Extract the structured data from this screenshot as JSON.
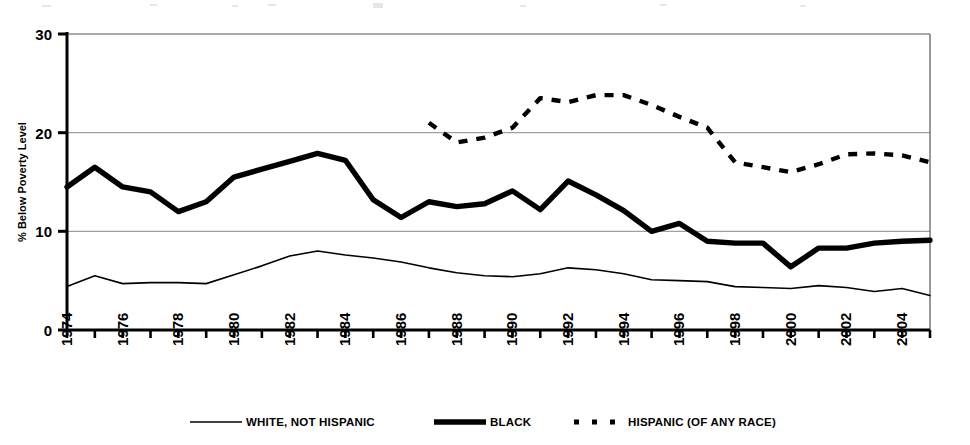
{
  "chart_data": {
    "type": "line",
    "title": "",
    "xlabel": "",
    "ylabel": "% Below Poverty Level",
    "xlim": [
      1974,
      2005
    ],
    "ylim": [
      0,
      30
    ],
    "yticks": [
      0,
      10,
      20,
      30
    ],
    "ytick_labels": [
      "0",
      "10",
      "20",
      "30"
    ],
    "xticks": [
      1974,
      1975,
      1976,
      1977,
      1978,
      1979,
      1980,
      1981,
      1982,
      1983,
      1984,
      1985,
      1986,
      1987,
      1988,
      1989,
      1990,
      1991,
      1992,
      1993,
      1994,
      1995,
      1996,
      1997,
      1998,
      1999,
      2000,
      2001,
      2002,
      2003,
      2004,
      2005
    ],
    "xtick_labels": [
      "1974",
      "",
      "1976",
      "",
      "1978",
      "",
      "1980",
      "",
      "1982",
      "",
      "1984",
      "",
      "1986",
      "",
      "1988",
      "",
      "1990",
      "",
      "1992",
      "",
      "1994",
      "",
      "1996",
      "",
      "1998",
      "",
      "2000",
      "",
      "2002",
      "",
      "2004",
      ""
    ],
    "grid": "horizontal",
    "legend_position": "bottom",
    "series": [
      {
        "name": "WHITE, NOT HISPANIC",
        "style": "thin-solid",
        "color": "#000000",
        "x": [
          1974,
          1975,
          1976,
          1977,
          1978,
          1979,
          1980,
          1981,
          1982,
          1983,
          1984,
          1985,
          1986,
          1987,
          1988,
          1989,
          1990,
          1991,
          1992,
          1993,
          1994,
          1995,
          1996,
          1997,
          1998,
          1999,
          2000,
          2001,
          2002,
          2003,
          2004,
          2005
        ],
        "values": [
          4.4,
          5.5,
          4.7,
          4.8,
          4.8,
          4.7,
          5.6,
          6.5,
          7.5,
          8.0,
          7.6,
          7.3,
          6.9,
          6.3,
          5.8,
          5.5,
          5.4,
          5.7,
          6.3,
          6.1,
          5.7,
          5.1,
          5.0,
          4.9,
          4.4,
          4.3,
          4.2,
          4.5,
          4.3,
          3.9,
          4.2,
          3.5
        ]
      },
      {
        "name": "BLACK",
        "style": "thick-solid",
        "color": "#000000",
        "x": [
          1974,
          1975,
          1976,
          1977,
          1978,
          1979,
          1980,
          1981,
          1982,
          1983,
          1984,
          1985,
          1986,
          1987,
          1988,
          1989,
          1990,
          1991,
          1992,
          1993,
          1994,
          1995,
          1996,
          1997,
          1998,
          1999,
          2000,
          2001,
          2002,
          2003,
          2004,
          2005
        ],
        "values": [
          14.5,
          16.5,
          14.5,
          14.0,
          12.0,
          13.0,
          15.5,
          16.3,
          17.1,
          17.9,
          17.2,
          13.2,
          11.4,
          13.0,
          12.5,
          12.8,
          14.1,
          12.2,
          15.1,
          13.7,
          12.1,
          10.0,
          10.8,
          9.0,
          8.8,
          8.8,
          6.4,
          8.3,
          8.3,
          8.8,
          9.0,
          9.1
        ]
      },
      {
        "name": "HISPANIC (OF ANY RACE)",
        "style": "dashed",
        "color": "#000000",
        "x": [
          1987,
          1988,
          1989,
          1990,
          1991,
          1992,
          1993,
          1994,
          1995,
          1996,
          1997,
          1998,
          1999,
          2000,
          2001,
          2002,
          2003,
          2004,
          2005
        ],
        "values": [
          21.0,
          19.0,
          19.5,
          20.5,
          23.5,
          23.1,
          23.8,
          23.8,
          22.8,
          21.6,
          20.5,
          17.0,
          16.5,
          16.0,
          16.8,
          17.8,
          17.9,
          17.7,
          17.0
        ]
      }
    ]
  },
  "axis": {
    "y_label": "% Below Poverty Level",
    "y_tick_labels": [
      "30",
      "20",
      "10",
      "0"
    ],
    "x_tick_labels": [
      "1974",
      "1976",
      "1978",
      "1980",
      "1982",
      "1984",
      "1986",
      "1988",
      "1990",
      "1992",
      "1994",
      "1996",
      "1998",
      "2000",
      "2002",
      "2004"
    ]
  },
  "legend": {
    "items": [
      {
        "label": "WHITE, NOT HISPANIC",
        "swatch": "thin-line-swatch"
      },
      {
        "label": "BLACK",
        "swatch": "thick-line-swatch"
      },
      {
        "label": "HISPANIC (OF ANY RACE)",
        "swatch": "dashed-line-swatch"
      }
    ]
  }
}
